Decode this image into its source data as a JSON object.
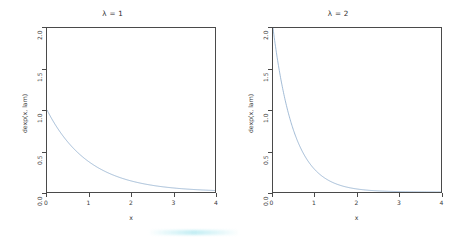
{
  "figure": {
    "background_color": "#ffffff",
    "frame_color": "#4a4a4a",
    "curve_color": "#7b9fc4",
    "artifact_color": "#b0e8f0"
  },
  "panels": [
    {
      "name": "panel-lambda-1",
      "title": "λ = 1",
      "lambda": 1,
      "xlabel": "x",
      "ylabel": "dexp(x, lam)",
      "xticks": [
        "0",
        "1",
        "2",
        "3",
        "4"
      ],
      "yticks": [
        "0.0",
        "0.5",
        "1.0",
        "1.5",
        "2.0"
      ]
    },
    {
      "name": "panel-lambda-2",
      "title": "λ = 2",
      "lambda": 2,
      "xlabel": "x",
      "ylabel": "dexp(x, lam)",
      "xticks": [
        "0",
        "1",
        "2",
        "3",
        "4"
      ],
      "yticks": [
        "0.0",
        "0.5",
        "1.0",
        "1.5",
        "2.0"
      ]
    }
  ],
  "chart_data": [
    {
      "type": "line",
      "title": "λ = 1",
      "xlabel": "x",
      "ylabel": "dexp(x, lam)",
      "xlim": [
        0,
        4
      ],
      "ylim": [
        0,
        2.0
      ],
      "xticks": [
        0,
        1,
        2,
        3,
        4
      ],
      "yticks": [
        0.0,
        0.5,
        1.0,
        1.5,
        2.0
      ],
      "grid": false,
      "legend": "none",
      "series": [
        {
          "name": "dexp(x, 1)",
          "color": "#7b9fc4",
          "x": [
            0.0,
            0.2,
            0.4,
            0.6,
            0.8,
            1.0,
            1.2,
            1.4,
            1.6,
            1.8,
            2.0,
            2.2,
            2.4,
            2.6,
            2.8,
            3.0,
            3.2,
            3.4,
            3.6,
            3.8,
            4.0
          ],
          "y": [
            1.0,
            0.8187,
            0.6703,
            0.5488,
            0.4493,
            0.3679,
            0.3012,
            0.2466,
            0.2019,
            0.1653,
            0.1353,
            0.1108,
            0.0907,
            0.0743,
            0.0608,
            0.0498,
            0.0408,
            0.0334,
            0.0273,
            0.0224,
            0.0183
          ]
        }
      ]
    },
    {
      "type": "line",
      "title": "λ = 2",
      "xlabel": "x",
      "ylabel": "dexp(x, lam)",
      "xlim": [
        0,
        4
      ],
      "ylim": [
        0,
        2.0
      ],
      "xticks": [
        0,
        1,
        2,
        3,
        4
      ],
      "yticks": [
        0.0,
        0.5,
        1.0,
        1.5,
        2.0
      ],
      "grid": false,
      "legend": "none",
      "series": [
        {
          "name": "dexp(x, 2)",
          "color": "#7b9fc4",
          "x": [
            0.0,
            0.2,
            0.4,
            0.6,
            0.8,
            1.0,
            1.2,
            1.4,
            1.6,
            1.8,
            2.0,
            2.2,
            2.4,
            2.6,
            2.8,
            3.0,
            3.2,
            3.4,
            3.6,
            3.8,
            4.0
          ],
          "y": [
            2.0,
            1.3406,
            0.8987,
            0.6024,
            0.4038,
            0.2707,
            0.1815,
            0.1216,
            0.0815,
            0.0546,
            0.0366,
            0.0245,
            0.0165,
            0.011,
            0.0074,
            0.005,
            0.0033,
            0.0022,
            0.0015,
            0.001,
            0.0007
          ]
        }
      ]
    }
  ]
}
